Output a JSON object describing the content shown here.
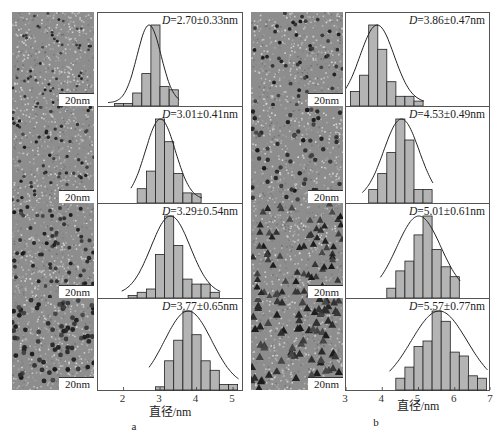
{
  "figure": {
    "panel_labels": [
      "a",
      "b"
    ],
    "xlabel": "直径/nm",
    "scale_bar": "20nm"
  },
  "colors": {
    "bar_fill": "#b4b4b4",
    "bar_stroke": "#222222",
    "curve": "#222222",
    "frame": "#555555"
  },
  "chart_data": [
    {
      "type": "bar",
      "panel": "a",
      "row": 1,
      "title": "D=2.70±0.33nm",
      "xlabel": "直径/nm",
      "ylabel": "",
      "xlim": [
        1.3,
        5.3
      ],
      "xticks": [
        2,
        3,
        4,
        5
      ],
      "bin_width": 0.25,
      "bins": [
        1.875,
        2.125,
        2.375,
        2.625,
        2.875,
        3.125,
        3.375
      ],
      "values": [
        3,
        3,
        16,
        40,
        100,
        24,
        20
      ],
      "fit": {
        "type": "gaussian",
        "mean": 2.7,
        "sd": 0.33
      }
    },
    {
      "type": "bar",
      "panel": "a",
      "row": 2,
      "title": "D=3.01±0.41nm",
      "xlabel": "直径/nm",
      "xlim": [
        1.3,
        5.3
      ],
      "xticks": [
        2,
        3,
        4,
        5
      ],
      "bin_width": 0.25,
      "bins": [
        2.5,
        2.75,
        3.0,
        3.25,
        3.5,
        3.75,
        4.0
      ],
      "values": [
        17,
        38,
        100,
        73,
        35,
        12,
        11
      ],
      "fit": {
        "type": "gaussian",
        "mean": 3.01,
        "sd": 0.41
      }
    },
    {
      "type": "bar",
      "panel": "a",
      "row": 3,
      "title": "D=3.29±0.54nm",
      "xlabel": "直径/nm",
      "xlim": [
        1.3,
        5.3
      ],
      "xticks": [
        2,
        3,
        4,
        5
      ],
      "bin_width": 0.25,
      "bins": [
        2.25,
        2.5,
        2.75,
        3.0,
        3.25,
        3.5,
        3.75,
        4.0,
        4.25,
        4.5
      ],
      "values": [
        3,
        7,
        11,
        53,
        100,
        64,
        23,
        17,
        17,
        7
      ],
      "fit": {
        "type": "gaussian",
        "mean": 3.29,
        "sd": 0.54
      }
    },
    {
      "type": "bar",
      "panel": "a",
      "row": 4,
      "title": "D=3.77±0.65nm",
      "xlabel": "直径/nm",
      "xlim": [
        1.3,
        5.3
      ],
      "xticks": [
        2,
        3,
        4,
        5
      ],
      "bin_width": 0.25,
      "bins": [
        3.0,
        3.25,
        3.5,
        3.75,
        4.0,
        4.25,
        4.5,
        4.75,
        5.0
      ],
      "values": [
        4,
        37,
        63,
        100,
        70,
        37,
        25,
        7,
        7
      ],
      "fit": {
        "type": "gaussian",
        "mean": 3.77,
        "sd": 0.65
      }
    },
    {
      "type": "bar",
      "panel": "b",
      "row": 1,
      "title": "D=3.86±0.47nm",
      "xlabel": "直径/nm",
      "xlim": [
        3,
        7
      ],
      "xticks": [
        3,
        4,
        5,
        6,
        7
      ],
      "bin_width": 0.25,
      "bins": [
        3.25,
        3.5,
        3.75,
        4.0,
        4.25,
        4.5,
        4.75,
        5.0
      ],
      "values": [
        18,
        38,
        100,
        70,
        30,
        12,
        12,
        6
      ],
      "fit": {
        "type": "gaussian",
        "mean": 3.86,
        "sd": 0.47
      }
    },
    {
      "type": "bar",
      "panel": "b",
      "row": 2,
      "title": "D=4.53±0.49nm",
      "xlabel": "直径/nm",
      "xlim": [
        3,
        7
      ],
      "xticks": [
        3,
        4,
        5,
        6,
        7
      ],
      "bin_width": 0.25,
      "bins": [
        3.75,
        4.0,
        4.25,
        4.5,
        4.75,
        5.0,
        5.25
      ],
      "values": [
        16,
        35,
        60,
        100,
        75,
        16,
        16
      ],
      "fit": {
        "type": "gaussian",
        "mean": 4.53,
        "sd": 0.49
      }
    },
    {
      "type": "bar",
      "panel": "b",
      "row": 3,
      "title": "D=5.01±0.61nm",
      "xlabel": "直径/nm",
      "xlim": [
        3,
        7
      ],
      "xticks": [
        3,
        4,
        5,
        6,
        7
      ],
      "bin_width": 0.25,
      "bins": [
        4.25,
        4.5,
        4.75,
        5.0,
        5.25,
        5.5,
        5.75,
        6.0
      ],
      "values": [
        12,
        33,
        45,
        77,
        100,
        59,
        38,
        26
      ],
      "fit": {
        "type": "gaussian",
        "mean": 5.01,
        "sd": 0.61
      }
    },
    {
      "type": "bar",
      "panel": "b",
      "row": 4,
      "title": "D=5.57±0.77nm",
      "xlabel": "直径/nm",
      "xlim": [
        3,
        7
      ],
      "xticks": [
        3,
        4,
        5,
        6,
        7
      ],
      "bin_width": 0.25,
      "bins": [
        4.5,
        4.75,
        5.0,
        5.25,
        5.5,
        5.75,
        6.0,
        6.25,
        6.5,
        6.75
      ],
      "values": [
        15,
        29,
        55,
        62,
        100,
        87,
        48,
        43,
        18,
        15
      ],
      "fit": {
        "type": "gaussian",
        "mean": 5.57,
        "sd": 0.77
      }
    }
  ]
}
